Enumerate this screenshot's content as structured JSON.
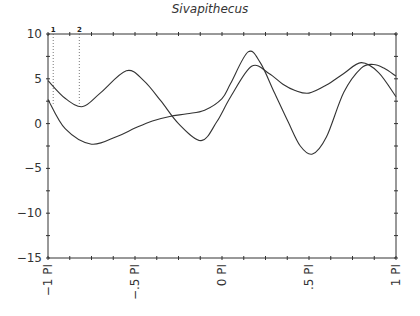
{
  "chart_data": {
    "type": "line",
    "title": "Sivapithecus",
    "xlabel": "",
    "ylabel": "",
    "xlim": [
      -1,
      1
    ],
    "ylim": [
      -15,
      10
    ],
    "x_tick_labels": [
      "−1 PI",
      "−.5 PI",
      "0 PI",
      ".5 PI",
      "1 PI"
    ],
    "x_ticks": [
      -1,
      -0.5,
      0,
      0.5,
      1
    ],
    "y_tick_labels": [
      "10",
      "5",
      "0",
      "−5",
      "−10",
      "−15"
    ],
    "y_ticks": [
      10,
      5,
      0,
      -5,
      -10,
      -15
    ],
    "grid": false,
    "markers": [
      {
        "label": "1",
        "x": -0.97
      },
      {
        "label": "2",
        "x": -0.82
      }
    ],
    "series": [
      {
        "name": "curve-1",
        "x": [
          -1,
          -0.9,
          -0.8,
          -0.7,
          -0.55,
          -0.45,
          -0.35,
          -0.25,
          -0.12,
          -0.03,
          0.05,
          0.17,
          0.27,
          0.35,
          0.42,
          0.5,
          0.6,
          0.7,
          0.8,
          0.9,
          1.0
        ],
        "values": [
          4.8,
          2.8,
          1.9,
          3.4,
          5.9,
          4.8,
          2.5,
          0.0,
          -1.9,
          0.2,
          3.0,
          6.4,
          5.6,
          4.4,
          3.7,
          3.4,
          4.3,
          5.6,
          6.8,
          5.7,
          3.0
        ]
      },
      {
        "name": "curve-2",
        "x": [
          -1,
          -0.9,
          -0.75,
          -0.6,
          -0.5,
          -0.4,
          -0.3,
          -0.2,
          -0.1,
          0.0,
          0.05,
          0.15,
          0.22,
          0.3,
          0.38,
          0.45,
          0.52,
          0.6,
          0.7,
          0.8,
          0.87,
          0.93,
          1.0
        ],
        "values": [
          2.7,
          -0.6,
          -2.3,
          -1.4,
          -0.5,
          0.3,
          0.8,
          1.1,
          1.5,
          2.8,
          4.5,
          8.0,
          6.8,
          3.5,
          0.2,
          -2.5,
          -3.4,
          -1.5,
          3.5,
          6.2,
          6.6,
          6.2,
          5.3
        ]
      }
    ]
  }
}
